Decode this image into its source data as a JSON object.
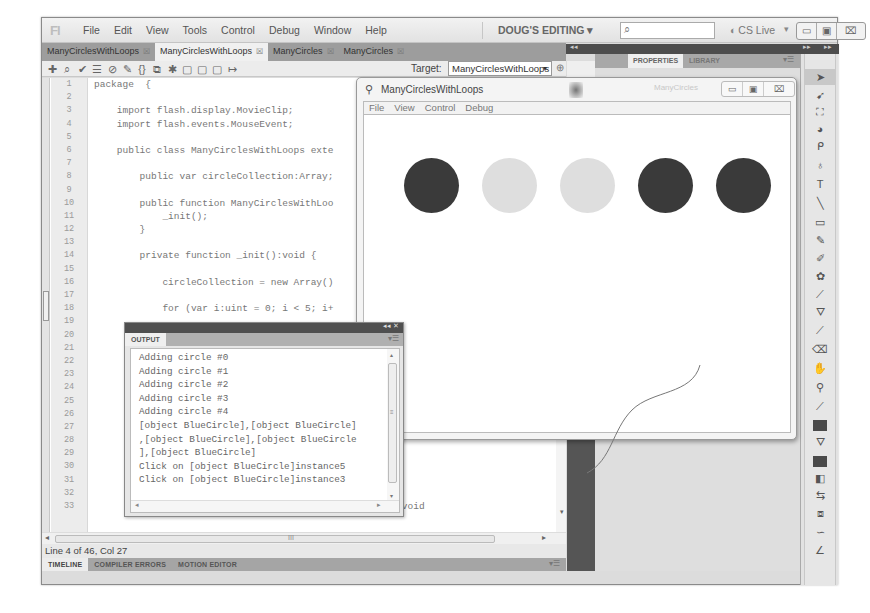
{
  "app": {
    "logo": "Fl",
    "menu": [
      "File",
      "Edit",
      "View",
      "Tools",
      "Control",
      "Debug",
      "Window",
      "Help"
    ],
    "workspace": "DOUG'S EDITING ▾",
    "search_placeholder": "",
    "search_icon": "⌕",
    "cs_live": "CS Live",
    "cs_live_icon": "◐",
    "cs_live_dropdown": "▾",
    "window_controls": {
      "minimize": "▭",
      "maximize": "▣",
      "close": "⌧"
    }
  },
  "doc_tabs": [
    {
      "label": "ManyCirclesWithLoops",
      "active": false
    },
    {
      "label": "ManyCirclesWithLoops",
      "active": true
    },
    {
      "label": "ManyCircles",
      "active": false
    },
    {
      "label": "ManyCircles",
      "active": false
    }
  ],
  "tab_close": "☒",
  "editor_toolbar": {
    "icons": [
      "✚",
      "⌕",
      "✔",
      "☰",
      "⊘",
      "✎",
      "{}",
      "⧉",
      "✱",
      "▢",
      "▢",
      "▢",
      "↦"
    ],
    "icon_names": [
      "add-statement-icon",
      "find-icon",
      "check-syntax-icon",
      "auto-format-icon",
      "code-hint-icon",
      "debug-options-icon",
      "collapse-between-braces-icon",
      "collapse-selection-icon",
      "expand-all-icon",
      "apply-block-comment-icon",
      "apply-line-comment-icon",
      "remove-comment-icon",
      "show-hide-toolbox-icon"
    ],
    "target_label": "Target:",
    "target_value": "ManyCirclesWithLoops",
    "target_dropdown": "▾",
    "pin_icon": "⊕"
  },
  "code": {
    "line_numbers": [
      "1",
      "2",
      "3",
      "4",
      "5",
      "6",
      "7",
      "8",
      "9",
      "10",
      "11",
      "12",
      "13",
      "14",
      "15",
      "16",
      "17",
      "18",
      "19",
      "20",
      "21",
      "22",
      "23",
      "24",
      "25",
      "26",
      "27",
      "28",
      "29",
      "30",
      "31",
      "32",
      "33"
    ],
    "lines": [
      "package  {",
      "",
      "    import flash.display.MovieClip;",
      "    import flash.events.MouseEvent;",
      "",
      "    public class ManyCirclesWithLoops exte",
      "",
      "        public var circleCollection:Array;",
      "",
      "        public function ManyCirclesWithLoo",
      "            _init();",
      "        }",
      "",
      "        private function _init():void {",
      "",
      "            circleCollection = new Array()",
      "",
      "            for (var i:uint = 0; i < 5; i+",
      "",
      "",
      "",
      "",
      "",
      "",
      "",
      "",
      "",
      "",
      "",
      "",
      "",
      "",
      "        private function _toggleVisible(e:MouseEvent):void"
    ],
    "hscroll_grip": "III",
    "scroll_left": "◂",
    "scroll_right": "▸",
    "scroll_down": "▾"
  },
  "status": {
    "text": "Line 4 of 46, Col 27"
  },
  "bottom_tabs": [
    {
      "label": "TIMELINE",
      "active": true
    },
    {
      "label": "COMPILER ERRORS",
      "active": false
    },
    {
      "label": "MOTION EDITOR",
      "active": false
    }
  ],
  "panel_menu_icon": "▾☰",
  "props_panel": {
    "collapse_left": "◂◂",
    "expand_right": "▸▸",
    "expand_right2": "▸▸",
    "tabs": [
      {
        "label": "PROPERTIES",
        "active": true
      },
      {
        "label": "LIBRARY",
        "active": false
      }
    ]
  },
  "tools": [
    {
      "name": "selection-tool-icon",
      "glyph": "➤",
      "selected": true
    },
    {
      "name": "subselection-tool-icon",
      "glyph": "➹"
    },
    {
      "name": "free-transform-tool-icon",
      "glyph": "⛶"
    },
    {
      "name": "3d-rotation-tool-icon",
      "glyph": "◕"
    },
    {
      "name": "lasso-tool-icon",
      "glyph": "ᑭ"
    },
    {
      "name": "pen-tool-icon",
      "glyph": "♁"
    },
    {
      "name": "text-tool-icon",
      "glyph": "T"
    },
    {
      "name": "line-tool-icon",
      "glyph": "╲"
    },
    {
      "name": "rectangle-tool-icon",
      "glyph": "▭"
    },
    {
      "name": "pencil-tool-icon",
      "glyph": "✎"
    },
    {
      "name": "brush-tool-icon",
      "glyph": "✐"
    },
    {
      "name": "deco-tool-icon",
      "glyph": "✿"
    },
    {
      "name": "bone-tool-icon",
      "glyph": "⟋"
    },
    {
      "name": "paint-bucket-tool-icon",
      "glyph": "⛛"
    },
    {
      "name": "eyedropper-tool-icon",
      "glyph": "⟋"
    },
    {
      "name": "eraser-tool-icon",
      "glyph": "⌫"
    },
    {
      "name": "hand-tool-icon",
      "glyph": "✋"
    },
    {
      "name": "zoom-tool-icon",
      "glyph": "⚲"
    },
    {
      "name": "stroke-color-pencil-icon",
      "glyph": "⟋"
    },
    {
      "name": "stroke-color-swatch",
      "swatch": true
    },
    {
      "name": "fill-color-bucket-icon",
      "glyph": "⛛"
    },
    {
      "name": "fill-color-swatch",
      "swatch": true
    },
    {
      "name": "black-white-icon",
      "glyph": "◧"
    },
    {
      "name": "swap-colors-icon",
      "glyph": "⇆"
    },
    {
      "name": "snap-to-objects-icon",
      "glyph": "⧈"
    },
    {
      "name": "smooth-icon",
      "glyph": "∽"
    },
    {
      "name": "straighten-icon",
      "glyph": "∠"
    }
  ],
  "player": {
    "title": "ManyCirclesWithLoops",
    "title_icon": "⚲",
    "ghost_text": "ManyCircles",
    "menu": [
      "File",
      "View",
      "Control",
      "Debug"
    ],
    "controls": {
      "minimize": "▭",
      "maximize": "▣",
      "close": "⌧"
    },
    "circles": [
      {
        "color": "#3a3a3a",
        "visible": true
      },
      {
        "color": "#dedede",
        "visible": false
      },
      {
        "color": "#dedede",
        "visible": false
      },
      {
        "color": "#3a3a3a",
        "visible": true
      },
      {
        "color": "#3a3a3a",
        "visible": true
      }
    ]
  },
  "output": {
    "tab": "OUTPUT",
    "header_controls": "◂◂ ✕",
    "lines": [
      "Adding circle #0",
      "Adding circle #1",
      "Adding circle #2",
      "Adding circle #3",
      "Adding circle #4",
      "[object BlueCircle],[object BlueCircle]",
      ",[object BlueCircle],[object BlueCircle",
      "],[object BlueCircle]",
      "Click on [object BlueCircle]instance5",
      "Click on [object BlueCircle]instance3"
    ],
    "scroll_up": "▴",
    "scroll_down": "▾",
    "scroll_grip": "≡",
    "scroll_left": "◂",
    "scroll_right": "▸"
  }
}
